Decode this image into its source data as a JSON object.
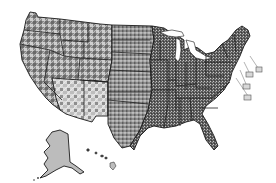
{
  "map": {
    "type": "choropleth",
    "subject": "United States counties",
    "color_scheme": "grayscale",
    "colors": {
      "background": "#ffffff",
      "dark": "#3a3a3a",
      "mid": "#7a7a7a",
      "light": "#c4c4c4",
      "outline": "#1a1a1a"
    },
    "regions": [
      {
        "name": "contiguous-us",
        "shading": "mixed county texture, darker in east"
      },
      {
        "name": "alaska-inset",
        "shading": "light gray"
      },
      {
        "name": "hawaii-inset",
        "shading": "dark gray"
      }
    ],
    "callouts": [
      {
        "name": "callout-box-1"
      },
      {
        "name": "callout-box-2"
      },
      {
        "name": "callout-box-3"
      },
      {
        "name": "callout-box-4"
      }
    ]
  }
}
